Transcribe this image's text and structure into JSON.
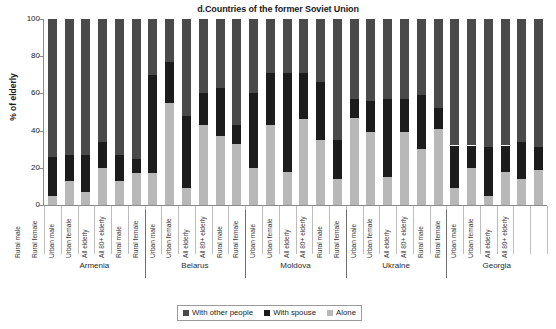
{
  "chart_data": {
    "type": "bar",
    "stacked": true,
    "title": "d.Countries of the former Soviet Union",
    "xlabel": "",
    "ylabel": "% of elderly",
    "ylim": [
      0,
      100
    ],
    "yticks": [
      0,
      20,
      40,
      60,
      80,
      100
    ],
    "grid": false,
    "legend_position": "bottom-center",
    "legend": [
      "With other people",
      "With spouse",
      "Alone"
    ],
    "colors": {
      "with_other_people": "#4a4a4a",
      "with_spouse": "#1c1c1c",
      "alone": "#b8b8b8"
    },
    "groups": [
      "Armenia",
      "Belarus",
      "Moldova",
      "Ukraine",
      "Georgia"
    ],
    "categories": [
      "Rural male",
      "Rural female",
      "Urban male",
      "Urban female",
      "All elderly",
      "All 80+ elderly"
    ],
    "bars": [
      {
        "group": "Armenia",
        "category": "Rural male",
        "alone": 5,
        "with_spouse": 21,
        "with_other_people": 74
      },
      {
        "group": "Armenia",
        "category": "Rural female",
        "alone": 13,
        "with_spouse": 14,
        "with_other_people": 73
      },
      {
        "group": "Armenia",
        "category": "Urban male",
        "alone": 7,
        "with_spouse": 20,
        "with_other_people": 73
      },
      {
        "group": "Armenia",
        "category": "Urban female",
        "alone": 20,
        "with_spouse": 14,
        "with_other_people": 66
      },
      {
        "group": "Armenia",
        "category": "All elderly",
        "alone": 13,
        "with_spouse": 14,
        "with_other_people": 73
      },
      {
        "group": "Armenia",
        "category": "All 80+ elderly",
        "alone": 17,
        "with_spouse": 8,
        "with_other_people": 75
      },
      {
        "group": "Belarus",
        "category": "Rural male",
        "alone": 17,
        "with_spouse": 53,
        "with_other_people": 30
      },
      {
        "group": "Belarus",
        "category": "Rural female",
        "alone": 55,
        "with_spouse": 22,
        "with_other_people": 23
      },
      {
        "group": "Belarus",
        "category": "Urban male",
        "alone": 9,
        "with_spouse": 39,
        "with_other_people": 52
      },
      {
        "group": "Belarus",
        "category": "Urban female",
        "alone": 43,
        "with_spouse": 17,
        "with_other_people": 40
      },
      {
        "group": "Belarus",
        "category": "All elderly",
        "alone": 37,
        "with_spouse": 26,
        "with_other_people": 37
      },
      {
        "group": "Belarus",
        "category": "All 80+ elderly",
        "alone": 33,
        "with_spouse": 10,
        "with_other_people": 57
      },
      {
        "group": "Moldova",
        "category": "Rural male",
        "alone": 20,
        "with_spouse": 40,
        "with_other_people": 40
      },
      {
        "group": "Moldova",
        "category": "Rural female",
        "alone": 43,
        "with_spouse": 28,
        "with_other_people": 29
      },
      {
        "group": "Moldova",
        "category": "Urban male",
        "alone": 18,
        "with_spouse": 53,
        "with_other_people": 29
      },
      {
        "group": "Moldova",
        "category": "Urban female",
        "alone": 46,
        "with_spouse": 25,
        "with_other_people": 29
      },
      {
        "group": "Moldova",
        "category": "All elderly",
        "alone": 35,
        "with_spouse": 31,
        "with_other_people": 34
      },
      {
        "group": "Moldova",
        "category": "All 80+ elderly",
        "alone": 14,
        "with_spouse": 21,
        "with_other_people": 65
      },
      {
        "group": "Ukraine",
        "category": "Rural male",
        "alone": 47,
        "with_spouse": 10,
        "with_other_people": 43
      },
      {
        "group": "Ukraine",
        "category": "Rural female",
        "alone": 39,
        "with_spouse": 17,
        "with_other_people": 44
      },
      {
        "group": "Ukraine",
        "category": "Urban male",
        "alone": 15,
        "with_spouse": 42,
        "with_other_people": 43
      },
      {
        "group": "Ukraine",
        "category": "Urban female",
        "alone": 39,
        "with_spouse": 18,
        "with_other_people": 43
      },
      {
        "group": "Ukraine",
        "category": "All elderly",
        "alone": 30,
        "with_spouse": 29,
        "with_other_people": 41
      },
      {
        "group": "Ukraine",
        "category": "All 80+ elderly",
        "alone": 41,
        "with_spouse": 11,
        "with_other_people": 48
      },
      {
        "group": "Georgia",
        "category": "Rural male",
        "alone": 9,
        "with_spouse": 23,
        "with_other_people": 68
      },
      {
        "group": "Georgia",
        "category": "Rural female",
        "alone": 20,
        "with_spouse": 12,
        "with_other_people": 68
      },
      {
        "group": "Georgia",
        "category": "Urban male",
        "alone": 5,
        "with_spouse": 26,
        "with_other_people": 69
      },
      {
        "group": "Georgia",
        "category": "Urban female",
        "alone": 18,
        "with_spouse": 14,
        "with_other_people": 68
      },
      {
        "group": "Georgia",
        "category": "All elderly",
        "alone": 14,
        "with_spouse": 20,
        "with_other_people": 66
      },
      {
        "group": "Georgia",
        "category": "All 80+ elderly",
        "alone": 19,
        "with_spouse": 12,
        "with_other_people": 69
      }
    ]
  }
}
